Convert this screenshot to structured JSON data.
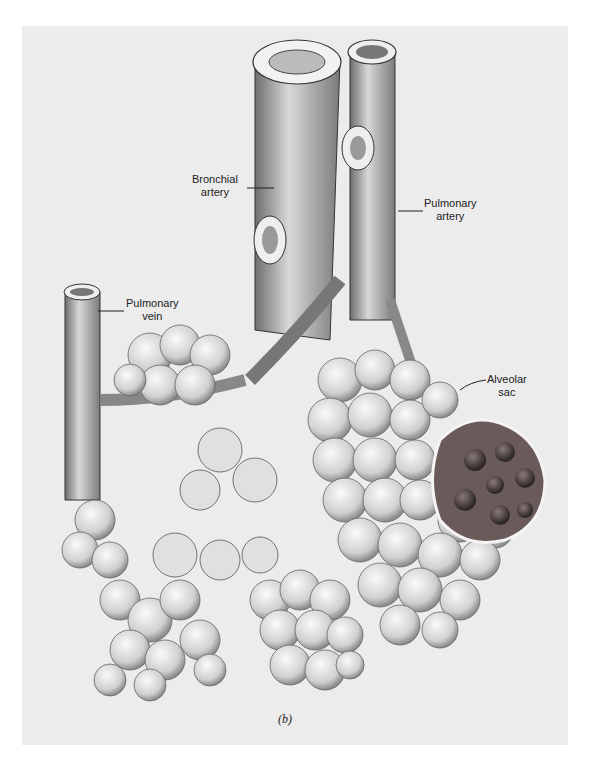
{
  "figure": {
    "caption": "(b)",
    "labels": {
      "bronchial_artery": [
        "Bronchial",
        "artery"
      ],
      "pulmonary_artery": [
        "Pulmonary",
        "artery"
      ],
      "pulmonary_vein": [
        "Pulmonary",
        "vein"
      ],
      "alveolar_sac": [
        "Alveolar",
        "sac"
      ]
    },
    "colors": {
      "background": "#ececec",
      "ink": "#222222",
      "shade": "#9a9a9a",
      "sac_dark": "#4a3f3f"
    }
  }
}
